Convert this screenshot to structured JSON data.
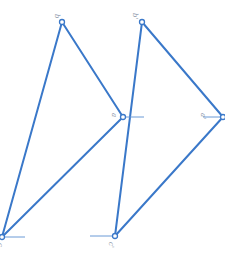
{
  "colors": {
    "edge": "#3a78c9",
    "tick": "#6b9ad6",
    "label": "#8a96a8",
    "background": "#ffffff"
  },
  "triangles": [
    {
      "name": "left",
      "vertices": [
        {
          "id": "top",
          "label": "b",
          "x": 62,
          "y": 22
        },
        {
          "id": "right",
          "label": "a",
          "x": 123,
          "y": 117
        },
        {
          "id": "bottom",
          "label": "c",
          "x": 2,
          "y": 237
        }
      ]
    },
    {
      "name": "right",
      "vertices": [
        {
          "id": "top",
          "label": "b'",
          "x": 142,
          "y": 22
        },
        {
          "id": "right",
          "label": "a'",
          "x": 223,
          "y": 117
        },
        {
          "id": "bottom",
          "label": "c'",
          "x": 115,
          "y": 236
        }
      ]
    }
  ],
  "labels": {
    "left_top": "b",
    "left_right": "a",
    "left_bottom": "c",
    "right_top": "b'",
    "right_right": "a'",
    "right_bottom": "c'"
  }
}
